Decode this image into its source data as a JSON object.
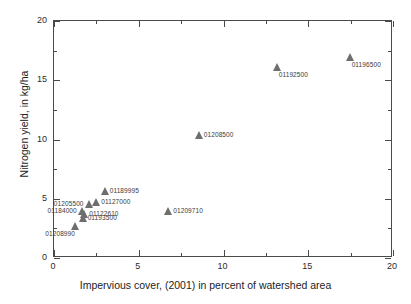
{
  "chart_data": {
    "type": "scatter",
    "title": "",
    "xlabel": "Impervious cover, (2001) in percent of watershed area",
    "ylabel": "Nitrogen yield, in kg/ha",
    "xlim": [
      0,
      20
    ],
    "ylim": [
      0,
      20
    ],
    "xticks": [
      0,
      5,
      10,
      15,
      20
    ],
    "yticks": [
      0,
      5,
      10,
      15,
      20
    ],
    "xtick_labels": [
      "0",
      "5",
      "10",
      "15",
      "20"
    ],
    "ytick_labels": [
      "0",
      "5",
      "10",
      "15",
      "20"
    ],
    "minor_ticks": true,
    "grid": false,
    "legend": null,
    "marker": "triangle",
    "marker_color": "#6e6e6e",
    "points": [
      {
        "label": "01208990",
        "x": 1.3,
        "y": 2.6,
        "label_pos": "below-left"
      },
      {
        "label": "01193500",
        "x": 1.75,
        "y": 3.3,
        "label_pos": "right"
      },
      {
        "label": "01122610",
        "x": 1.85,
        "y": 3.6,
        "label_pos": "right"
      },
      {
        "label": "01184000",
        "x": 1.7,
        "y": 3.9,
        "label_pos": "left"
      },
      {
        "label": "01205500",
        "x": 2.1,
        "y": 4.45,
        "label_pos": "left"
      },
      {
        "label": "01127000",
        "x": 2.55,
        "y": 4.65,
        "label_pos": "right"
      },
      {
        "label": "01189995",
        "x": 3.05,
        "y": 5.6,
        "label_pos": "right"
      },
      {
        "label": "01209710",
        "x": 6.8,
        "y": 3.9,
        "label_pos": "right"
      },
      {
        "label": "01208500",
        "x": 8.6,
        "y": 10.3,
        "label_pos": "right"
      },
      {
        "label": "01192500",
        "x": 13.2,
        "y": 16.0,
        "label_pos": "below"
      },
      {
        "label": "01196500",
        "x": 17.5,
        "y": 16.9,
        "label_pos": "below"
      }
    ]
  }
}
